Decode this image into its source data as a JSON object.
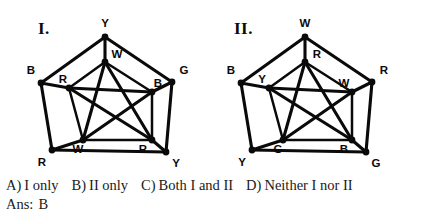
{
  "figures": [
    {
      "id": "figure-1",
      "title": "I.",
      "title_pos": [
        38,
        34
      ],
      "outer": {
        "points": [
          {
            "x": 105,
            "y": 37,
            "label": "Y",
            "lx": 105,
            "ly": 24
          },
          {
            "x": 172,
            "y": 82,
            "label": "G",
            "lx": 184,
            "ly": 71
          },
          {
            "x": 166,
            "y": 152,
            "label": "Y",
            "lx": 176,
            "ly": 164
          },
          {
            "x": 52,
            "y": 150,
            "label": "R",
            "lx": 42,
            "ly": 163
          },
          {
            "x": 41,
            "y": 83,
            "label": "B",
            "lx": 31,
            "ly": 71
          }
        ]
      },
      "inner": {
        "points": [
          {
            "x": 105,
            "y": 62,
            "label": "W",
            "lx": 117,
            "ly": 55
          },
          {
            "x": 152,
            "y": 92,
            "label": "B",
            "lx": 158,
            "ly": 84
          },
          {
            "x": 152,
            "y": 140,
            "label": "R",
            "lx": 143,
            "ly": 150
          },
          {
            "x": 83,
            "y": 140,
            "label": "W",
            "lx": 78,
            "ly": 150
          },
          {
            "x": 69,
            "y": 88,
            "label": "R",
            "lx": 63,
            "ly": 80
          }
        ]
      }
    },
    {
      "id": "figure-2",
      "title": "II.",
      "title_pos": [
        16,
        34
      ],
      "outer": {
        "points": [
          {
            "x": 87,
            "y": 37,
            "label": "W",
            "lx": 87,
            "ly": 24
          },
          {
            "x": 154,
            "y": 82,
            "label": "R",
            "lx": 166,
            "ly": 71
          },
          {
            "x": 148,
            "y": 152,
            "label": "G",
            "lx": 158,
            "ly": 164
          },
          {
            "x": 34,
            "y": 150,
            "label": "Y",
            "lx": 24,
            "ly": 163
          },
          {
            "x": 23,
            "y": 83,
            "label": "B",
            "lx": 13,
            "ly": 71
          }
        ]
      },
      "inner": {
        "points": [
          {
            "x": 87,
            "y": 62,
            "label": "R",
            "lx": 99,
            "ly": 55
          },
          {
            "x": 134,
            "y": 92,
            "label": "W",
            "lx": 126,
            "ly": 84
          },
          {
            "x": 134,
            "y": 140,
            "label": "B",
            "lx": 126,
            "ly": 150
          },
          {
            "x": 65,
            "y": 140,
            "label": "G",
            "lx": 60,
            "ly": 150
          },
          {
            "x": 51,
            "y": 88,
            "label": "Y",
            "lx": 44,
            "ly": 80
          }
        ]
      }
    }
  ],
  "choices": [
    {
      "letter": "A)",
      "text": "I only"
    },
    {
      "letter": "B)",
      "text": "II only"
    },
    {
      "letter": "C)",
      "text": "Both I and II"
    },
    {
      "letter": "D)",
      "text": "Neither I nor II"
    }
  ],
  "answer": {
    "label": "Ans:",
    "value": "B"
  },
  "colors": {
    "ink": "#0a0a0a",
    "paper": "#ffffff",
    "text": "#1a1a1a"
  }
}
